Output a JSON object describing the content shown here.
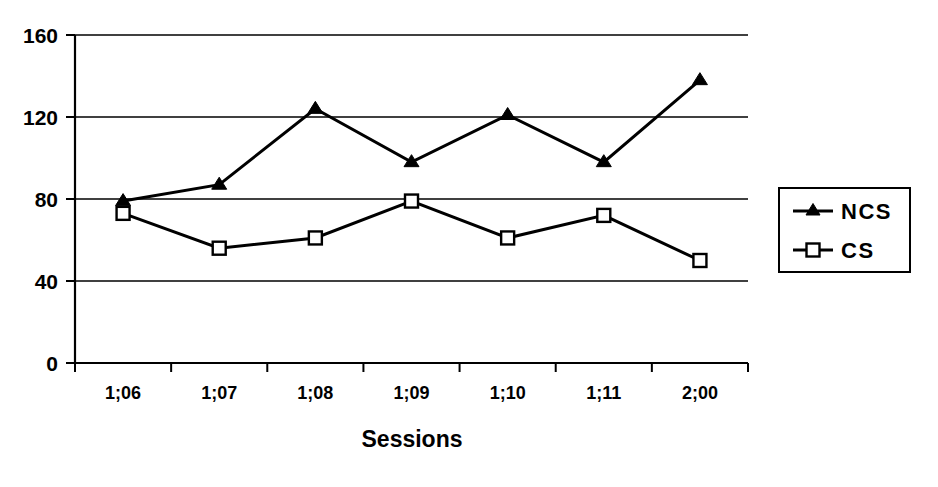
{
  "chart_data": {
    "type": "line",
    "title": "",
    "xlabel": "Sessions",
    "ylabel": "",
    "categories": [
      "1;06",
      "1;07",
      "1;08",
      "1;09",
      "1;10",
      "1;11",
      "2;00"
    ],
    "series": [
      {
        "name": "NCS",
        "marker": "filled-triangle",
        "color": "#000000",
        "values": [
          79,
          87,
          124,
          98,
          121,
          98,
          138
        ]
      },
      {
        "name": "CS",
        "marker": "open-square",
        "color": "#000000",
        "values": [
          73,
          56,
          61,
          79,
          61,
          72,
          50
        ]
      }
    ],
    "ylim": [
      0,
      160
    ],
    "yticks": [
      0,
      40,
      80,
      120,
      160
    ],
    "ytick_labels": [
      "0",
      "40",
      "80",
      "120",
      "160"
    ],
    "grid": "horizontal",
    "legend_position": "right",
    "legend_entries": [
      "NCS",
      "CS"
    ]
  }
}
